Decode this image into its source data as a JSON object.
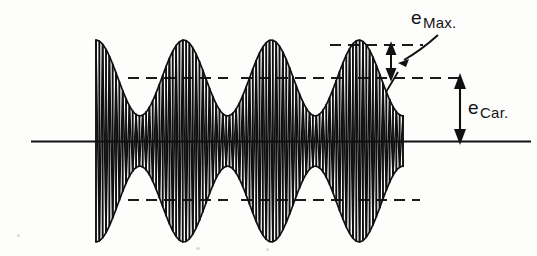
{
  "figure": {
    "background_color": "#fdfdfc",
    "ink_color": "#111111"
  },
  "labels": {
    "e_max": {
      "base": "e",
      "subscript": "Max."
    },
    "e_car": {
      "base": "e",
      "subscript": "Car."
    }
  },
  "icons": {
    "leader_line": "curved-leader-line-icon",
    "emax_arrow": "double-headed-arrow-icon",
    "ecar_arrow": "double-headed-arrow-icon"
  },
  "chart_data": {
    "type": "line",
    "xlabel": "",
    "ylabel": "",
    "grid": false,
    "legend": null,
    "annotations": [
      {
        "name": "e-max-label",
        "text": "e Max.",
        "meaning": "peak envelope amplitude above carrier peak level",
        "x": 411,
        "y": 18
      },
      {
        "name": "e-car-label",
        "text": "e Car.",
        "meaning": "unmodulated carrier peak amplitude measured from zero axis",
        "x": 468,
        "y": 108
      }
    ],
    "reference_levels": {
      "zero_axis_y": 141,
      "carrier_peak_positive_y": 78,
      "carrier_peak_negative_y": 200,
      "envelope_peak_positive_y": 45,
      "envelope_peak_negative_y": 234
    },
    "signal": {
      "carrier_cycles_visible": 46,
      "modulation_cycles_visible": 3.5,
      "carrier_peak_amplitude": 1.0,
      "modulation_index": 0.6,
      "envelope_max_amplitude": 1.6,
      "envelope_min_amplitude": 0.4,
      "x_start": 96,
      "x_end": 403
    },
    "dashed_guides": [
      {
        "name": "envelope-peak-top",
        "y": 45,
        "x1": 330,
        "x2": 423
      },
      {
        "name": "carrier-peak-top-left",
        "y": 78,
        "x1": 128,
        "x2": 228
      },
      {
        "name": "carrier-peak-top-mid",
        "y": 78,
        "x1": 241,
        "x2": 345
      },
      {
        "name": "carrier-peak-top-right",
        "y": 78,
        "x1": 358,
        "x2": 464
      },
      {
        "name": "carrier-peak-bottom-left",
        "y": 200,
        "x1": 128,
        "x2": 228
      },
      {
        "name": "carrier-peak-bottom-mid",
        "y": 200,
        "x1": 241,
        "x2": 345
      },
      {
        "name": "carrier-peak-bottom-right",
        "y": 200,
        "x1": 358,
        "x2": 420
      }
    ],
    "axis_line": {
      "name": "zero-axis",
      "y": 141,
      "x1": 31,
      "x2": 531
    }
  }
}
